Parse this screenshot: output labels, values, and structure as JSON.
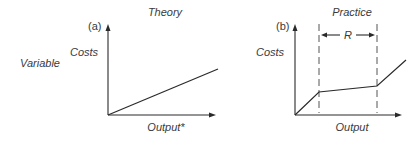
{
  "side_label": "Variable",
  "panels": [
    {
      "id": "a",
      "tag": "(a)",
      "title": "Theory",
      "y_label": "Costs",
      "x_label": "Output*",
      "curve": "linear"
    },
    {
      "id": "b",
      "tag": "(b)",
      "title": "Practice",
      "y_label": "Costs",
      "x_label": "Output",
      "range_label": "R",
      "curve": "piecewise: steep, flat within range R, steep"
    }
  ]
}
